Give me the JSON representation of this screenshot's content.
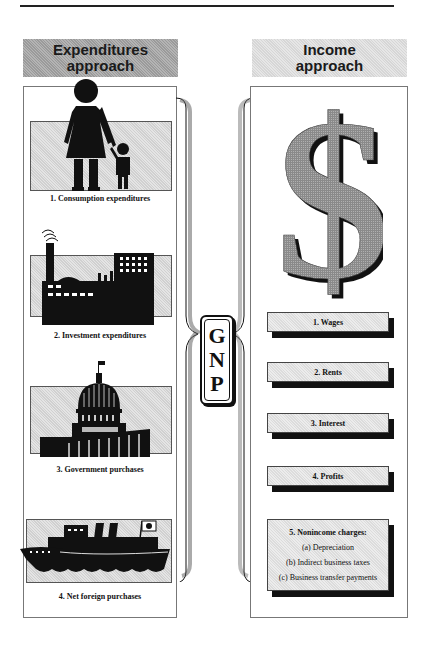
{
  "left_section": {
    "header": "Expenditures approach",
    "items": [
      {
        "number": "1.",
        "label": "1.  Consumption expenditures",
        "icon": "family-icon"
      },
      {
        "number": "2.",
        "label": "2.  Investment expenditures",
        "icon": "factory-icon"
      },
      {
        "number": "3.",
        "label": "3.  Government purchases",
        "icon": "capitol-icon"
      },
      {
        "number": "4.",
        "label": "4.  Net foreign purchases",
        "icon": "ship-icon"
      }
    ]
  },
  "center": {
    "label_lines": [
      "G",
      "N",
      "P"
    ]
  },
  "right_section": {
    "header": "Income approach",
    "icon": "dollar-sign-icon",
    "items": [
      {
        "label": "1.  Wages"
      },
      {
        "label": "2.  Rents"
      },
      {
        "label": "3.  Interest"
      },
      {
        "label": "4.  Profits"
      },
      {
        "label": "5.  Nonincome charges:",
        "sub_items": [
          "(a) Depreciation",
          "(b) Indirect business taxes",
          "(c)  Business transfer payments"
        ]
      }
    ]
  },
  "colors": {
    "ink": "#111111",
    "left_header_fill": "#a8a8a8",
    "right_header_fill": "#e0e0e0",
    "box_fill": "#e6e6e6",
    "shadow": "#111111"
  }
}
